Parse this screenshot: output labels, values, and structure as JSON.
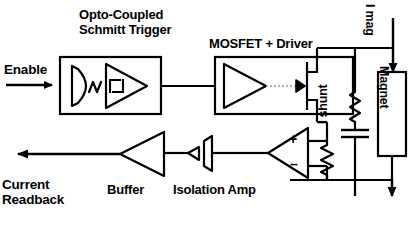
{
  "diagram": {
    "title_blocks": {
      "opto": "Opto-Coupled\nSchmitt Trigger",
      "mosfet": "MOSFET + Driver"
    },
    "signals": {
      "enable": "Enable",
      "current_readback": "Current\nReadback",
      "i_shunt": "I shunt",
      "i_mag": "I mag"
    },
    "blocks": {
      "buffer": "Buffer",
      "isolation_amp": "Isolation Amp",
      "magnet": "Magnet"
    },
    "opamp": {
      "plus": "+",
      "minus": "–"
    },
    "colors": {
      "ink": "#000000",
      "background": "#ffffff",
      "dashed": "#999999"
    }
  }
}
